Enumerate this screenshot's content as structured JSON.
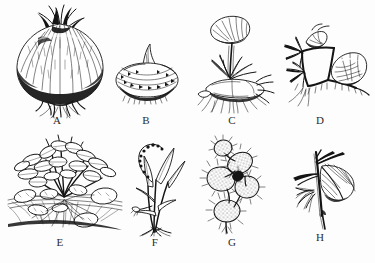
{
  "plate": {
    "title": "Vegetative propagation structures",
    "background_color": "#fdfdfd",
    "ink_color": "#141414",
    "label_color": "#2b2b2b",
    "width": 375,
    "height": 263,
    "rows": 2,
    "columns": 4
  },
  "figures": [
    {
      "id": "A",
      "label": "A",
      "name": "bulb",
      "description": "Shaded onion bulb with tunic layers and basal roots",
      "row": 1,
      "column": 1,
      "label_x": 57,
      "label_y": 116
    },
    {
      "id": "B",
      "label": "B",
      "name": "corm",
      "description": "Squat corm with papery ring scales and a single shoot tip",
      "row": 1,
      "column": 2,
      "label_x": 146,
      "label_y": 116
    },
    {
      "id": "C",
      "label": "C",
      "name": "rhizome",
      "description": "Creeping rhizome with upright leaf on a long petiole and fibrous roots",
      "row": 1,
      "column": 3,
      "label_x": 232,
      "label_y": 116
    },
    {
      "id": "D",
      "label": "D",
      "name": "stolon",
      "description": "Horizontal stolon with nodes rooting and new leafy plantlets",
      "row": 1,
      "column": 4,
      "label_x": 320,
      "label_y": 116
    },
    {
      "id": "E",
      "label": "E",
      "name": "tuber",
      "description": "Potato plant with leafy shoots and tubers borne on underground stems",
      "row": 2,
      "column": 1,
      "label_x": 60,
      "label_y": 238
    },
    {
      "id": "F",
      "label": "F",
      "name": "bulbil",
      "description": "Slender grassy stem bearing a curving bulbil shoot",
      "row": 2,
      "column": 2,
      "label_x": 155,
      "label_y": 238
    },
    {
      "id": "G",
      "label": "G",
      "name": "pad-offset",
      "description": "Prickly pear cactus with jointed spiny pads forming offsets",
      "row": 2,
      "column": 3,
      "label_x": 232,
      "label_y": 238
    },
    {
      "id": "H",
      "label": "H",
      "name": "stem-cutting",
      "description": "Stem cutting with one leaf and adventitious roots at the node",
      "row": 2,
      "column": 4,
      "label_x": 320,
      "label_y": 233
    }
  ]
}
